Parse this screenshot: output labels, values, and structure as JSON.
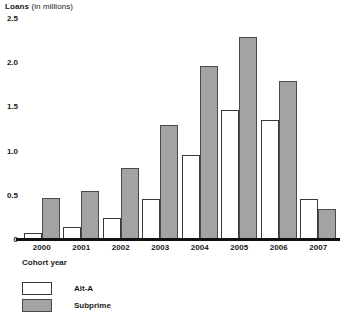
{
  "chart_data": {
    "type": "bar",
    "title": "Loans (in millions)",
    "title_bold_part": "Loans",
    "title_rest": " (in millions)",
    "xlabel": "Cohort year",
    "ylabel": "Loans (in millions)",
    "categories": [
      "2000",
      "2001",
      "2002",
      "2003",
      "2004",
      "2005",
      "2006",
      "2007"
    ],
    "series": [
      {
        "name": "Alt-A",
        "color": "#ffffff",
        "values": [
          0.07,
          0.14,
          0.24,
          0.45,
          0.95,
          1.46,
          1.35,
          0.45
        ]
      },
      {
        "name": "Subprime",
        "color": "#a3a3a3",
        "values": [
          0.46,
          0.54,
          0.8,
          1.29,
          1.96,
          2.29,
          1.79,
          0.34
        ]
      }
    ],
    "ylim": [
      0,
      2.5
    ],
    "yticks": [
      "0",
      "0.5",
      "1.0",
      "1.5",
      "2.0",
      "2.5"
    ],
    "ytick_values": [
      0,
      0.5,
      1.0,
      1.5,
      2.0,
      2.5
    ],
    "grid": false,
    "legend_position": "bottom-left"
  }
}
